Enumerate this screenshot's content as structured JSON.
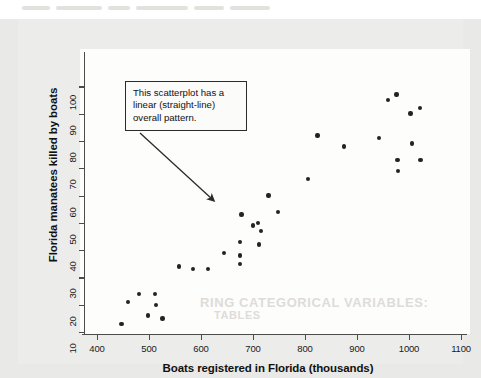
{
  "figure": {
    "panel_background": "#ececeb",
    "plot_background": "#fdfdfc",
    "page_background": "#e9e9e7",
    "dot_color": "#232323",
    "axis_color": "#4c4c4c"
  },
  "callout": {
    "text": "This scatterplot has a linear (straight-line) overall pattern.",
    "border_color": "#2b2b2b"
  },
  "ghost_text": {
    "line1": "RING CATEGORICAL VARIABLES:",
    "line2": "TABLES"
  },
  "chart_data": {
    "type": "scatter",
    "title": "",
    "xlabel": "Boats registered in Florida (thousands)",
    "ylabel": "Florida manatees killed by boats",
    "xlim": [
      370,
      1130
    ],
    "ylim": [
      8,
      104
    ],
    "xticks": [
      400,
      500,
      600,
      700,
      800,
      900,
      1000,
      1100
    ],
    "yticks": [
      10,
      20,
      30,
      40,
      50,
      60,
      70,
      80,
      90,
      100
    ],
    "grid": false,
    "legend": null,
    "annotations": [
      {
        "text": "This scatterplot has a linear (straight-line) overall pattern.",
        "points_to": [
          625,
          54
        ]
      }
    ],
    "points": [
      {
        "x": 447,
        "y": 13
      },
      {
        "x": 460,
        "y": 21
      },
      {
        "x": 481,
        "y": 24
      },
      {
        "x": 498,
        "y": 16
      },
      {
        "x": 513,
        "y": 20
      },
      {
        "x": 512,
        "y": 24
      },
      {
        "x": 526,
        "y": 15
      },
      {
        "x": 558,
        "y": 34
      },
      {
        "x": 585,
        "y": 33
      },
      {
        "x": 613,
        "y": 33
      },
      {
        "x": 644,
        "y": 39
      },
      {
        "x": 675,
        "y": 35
      },
      {
        "x": 675,
        "y": 38
      },
      {
        "x": 675,
        "y": 43
      },
      {
        "x": 678,
        "y": 53
      },
      {
        "x": 700,
        "y": 49
      },
      {
        "x": 709,
        "y": 50
      },
      {
        "x": 712,
        "y": 42
      },
      {
        "x": 715,
        "y": 47
      },
      {
        "x": 730,
        "y": 60
      },
      {
        "x": 748,
        "y": 54
      },
      {
        "x": 806,
        "y": 66
      },
      {
        "x": 824,
        "y": 82
      },
      {
        "x": 875,
        "y": 78
      },
      {
        "x": 942,
        "y": 81
      },
      {
        "x": 960,
        "y": 95
      },
      {
        "x": 976,
        "y": 97
      },
      {
        "x": 978,
        "y": 73
      },
      {
        "x": 979,
        "y": 69
      },
      {
        "x": 1003,
        "y": 90
      },
      {
        "x": 1006,
        "y": 79
      },
      {
        "x": 1021,
        "y": 92
      },
      {
        "x": 1022,
        "y": 73
      }
    ]
  }
}
